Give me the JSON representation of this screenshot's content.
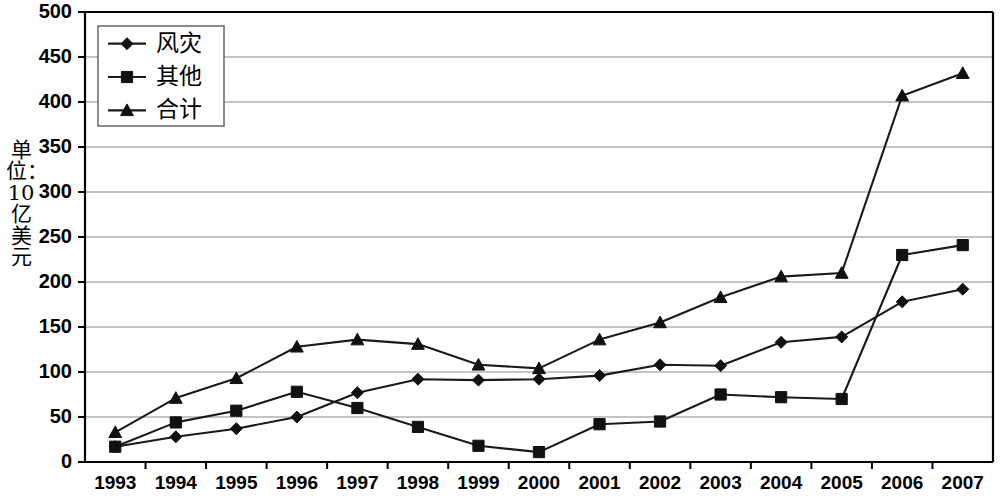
{
  "chart_data": {
    "type": "line",
    "title": "",
    "xlabel": "",
    "ylabel": "单位：10亿美元",
    "ylim": [
      0,
      500
    ],
    "ytick_step": 50,
    "yticks": [
      0,
      50,
      100,
      150,
      200,
      250,
      300,
      350,
      400,
      450,
      500
    ],
    "grid": true,
    "legend_position": "upper-left-inside",
    "categories": [
      "1993",
      "1994",
      "1995",
      "1996",
      "1997",
      "1998",
      "1999",
      "2000",
      "2001",
      "2002",
      "2003",
      "2004",
      "2005",
      "2006",
      "2007"
    ],
    "series": [
      {
        "name": "风灾",
        "marker": "diamond",
        "values": [
          17,
          28,
          37,
          50,
          77,
          92,
          91,
          92,
          96,
          108,
          107,
          133,
          139,
          178,
          192
        ]
      },
      {
        "name": "其他",
        "marker": "square",
        "values": [
          17,
          44,
          57,
          78,
          60,
          39,
          18,
          11,
          42,
          45,
          75,
          72,
          70,
          230,
          241
        ]
      },
      {
        "name": "合计",
        "marker": "triangle",
        "values": [
          33,
          71,
          93,
          128,
          136,
          131,
          108,
          104,
          136,
          155,
          183,
          206,
          210,
          407,
          432
        ]
      }
    ]
  },
  "axis": {
    "ytick_labels": [
      "0",
      "50",
      "100",
      "150",
      "200",
      "250",
      "300",
      "350",
      "400",
      "450",
      "500"
    ],
    "xtick_labels": [
      "1993",
      "1994",
      "1995",
      "1996",
      "1997",
      "1998",
      "1999",
      "2000",
      "2001",
      "2002",
      "2003",
      "2004",
      "2005",
      "2006",
      "2007"
    ]
  },
  "legend": {
    "entries": [
      "风灾",
      "其他",
      "合计"
    ]
  },
  "colors": {
    "line": "#1a1a1a",
    "grid": "#8a8a8a",
    "axis": "#000000",
    "background": "#ffffff",
    "legend_border": "#5a5a5a"
  }
}
